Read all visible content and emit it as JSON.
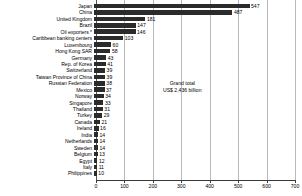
{
  "chart_data": {
    "type": "bar",
    "orientation": "horizontal",
    "title": "",
    "xlabel": "",
    "ylabel": "",
    "xlim": [
      0,
      700
    ],
    "xticks": [
      0,
      100,
      200,
      300,
      400,
      500,
      600,
      700
    ],
    "grid": true,
    "legend": "none",
    "bar_color": "#2b2b2b",
    "categories": [
      "Japan",
      "China",
      "United Kingdom",
      "Brazil",
      "Oil exporters *",
      "Caribbean banking centers",
      "Luxembourg",
      "Hong Kong SAR",
      "Germany",
      "Rep. of Korea",
      "Switzerland",
      "Taiwan Province of China",
      "Russian Federation",
      "Mexico",
      "Norway",
      "Singapore",
      "Thailand",
      "Turkey",
      "Canada",
      "Ireland",
      "India",
      "Netherlands",
      "Sweden",
      "Belgium",
      "Egypt",
      "Italy",
      "Philippines"
    ],
    "values": [
      547,
      487,
      181,
      147,
      146,
      103,
      60,
      58,
      43,
      41,
      39,
      39,
      38,
      37,
      34,
      33,
      31,
      29,
      21,
      16,
      14,
      14,
      14,
      13,
      12,
      11,
      10
    ],
    "value_labels": [
      "547",
      "487",
      "181",
      "147",
      "146",
      "103",
      "60",
      "58",
      "43",
      "41",
      "39",
      "39",
      "38",
      "37",
      "34",
      "33",
      "31",
      "29",
      "21",
      "16",
      "14",
      "14",
      "14",
      "13",
      "12",
      "11",
      "10"
    ],
    "annotations": [
      {
        "line1": "Grand total",
        "line2": "US$ 2,436 billion"
      }
    ]
  }
}
